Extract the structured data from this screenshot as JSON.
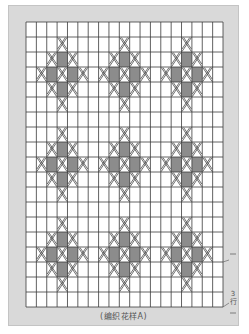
{
  "diagram": {
    "type": "knitting_chart",
    "title": "(编织花样A)",
    "grid": {
      "columns": 19,
      "rows": 19,
      "left": 26,
      "top": 22,
      "width": 197,
      "height": 285
    },
    "motif": {
      "description": "diamond: center cross stitch, gray squares at orthogonal neighbours, cross stitches at diagonals and at 4 tips",
      "centers": [
        {
          "row": 3,
          "col": 3
        },
        {
          "row": 3,
          "col": 9
        },
        {
          "row": 3,
          "col": 15
        },
        {
          "row": 9,
          "col": 3
        },
        {
          "row": 9,
          "col": 9
        },
        {
          "row": 9,
          "col": 15
        },
        {
          "row": 15,
          "col": 3
        },
        {
          "row": 15,
          "col": 9
        },
        {
          "row": 15,
          "col": 15
        }
      ]
    },
    "symbols": {
      "filled_cell": "gray-square",
      "cross_cell": "cross-stitch-x"
    },
    "row_annotation": {
      "count": "3",
      "unit": "行"
    },
    "colors": {
      "panel": "#d9d9d9",
      "grid_line": "#3a3a3a",
      "cell_bg": "#ffffff",
      "filled": "#8c8c8c",
      "cross": "#4a4a4a"
    }
  }
}
